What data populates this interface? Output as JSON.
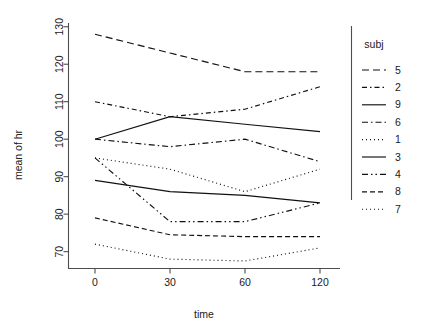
{
  "chart_data": {
    "type": "line",
    "title": "",
    "xlabel": "time",
    "ylabel": "mean of hr",
    "categories": [
      "0",
      "30",
      "60",
      "120"
    ],
    "x_tick_labels": [
      "0",
      "30",
      "60",
      "120"
    ],
    "y_tick_labels": [
      "70",
      "80",
      "90",
      "100",
      "110",
      "120",
      "130"
    ],
    "y_ticks": [
      70,
      80,
      90,
      100,
      110,
      120,
      130
    ],
    "ylim": [
      65.5,
      131
    ],
    "grid": false,
    "legend_position": "right",
    "legend_title": "subj",
    "series": [
      {
        "name": "5",
        "values": [
          128,
          123,
          118,
          118
        ],
        "dash": "7,4"
      },
      {
        "name": "2",
        "values": [
          110,
          106,
          108,
          114
        ],
        "dash": "5,3,1.5,3"
      },
      {
        "name": "9",
        "values": [
          100,
          106,
          104,
          102
        ],
        "dash": "none"
      },
      {
        "name": "6",
        "values": [
          100,
          98,
          100,
          94
        ],
        "dash": "6,3,1.5,3"
      },
      {
        "name": "1",
        "values": [
          95,
          92,
          86,
          92
        ],
        "dash": "1,3"
      },
      {
        "name": "3",
        "values": [
          89,
          86,
          85,
          83
        ],
        "dash": "none"
      },
      {
        "name": "4",
        "values": [
          95,
          78,
          78,
          83
        ],
        "dash": "6,3,1.5,3,1.5,3"
      },
      {
        "name": "8",
        "values": [
          79,
          74.5,
          74,
          74
        ],
        "dash": "5,3"
      },
      {
        "name": "7",
        "values": [
          72,
          68,
          67.5,
          71
        ],
        "dash": "1,3"
      }
    ]
  },
  "legend": {
    "title": "subj",
    "entries": [
      "5",
      "2",
      "9",
      "6",
      "1",
      "3",
      "4",
      "8",
      "7"
    ]
  },
  "axes": {
    "x_title": "time",
    "y_title": "mean of hr"
  },
  "colors": {
    "line": "#111111",
    "axis": "#4d4d4d",
    "background": "#ffffff"
  }
}
